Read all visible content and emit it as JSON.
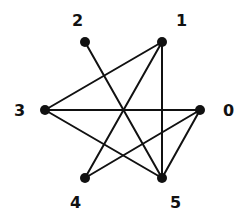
{
  "diagram": {
    "type": "graph",
    "nodes": [
      {
        "id": "0",
        "label": "0",
        "x": 200,
        "y": 110,
        "lx": 223,
        "ly": 116
      },
      {
        "id": "1",
        "label": "1",
        "x": 162,
        "y": 42,
        "lx": 176,
        "ly": 26
      },
      {
        "id": "2",
        "label": "2",
        "x": 85,
        "y": 42,
        "lx": 72,
        "ly": 26
      },
      {
        "id": "3",
        "label": "3",
        "x": 45,
        "y": 110,
        "lx": 14,
        "ly": 116
      },
      {
        "id": "4",
        "label": "4",
        "x": 85,
        "y": 178,
        "lx": 70,
        "ly": 208
      },
      {
        "id": "5",
        "label": "5",
        "x": 162,
        "y": 178,
        "lx": 170,
        "ly": 208
      }
    ],
    "edges": [
      [
        "1",
        "3"
      ],
      [
        "1",
        "5"
      ],
      [
        "1",
        "4"
      ],
      [
        "2",
        "5"
      ],
      [
        "3",
        "0"
      ],
      [
        "3",
        "5"
      ],
      [
        "0",
        "4"
      ],
      [
        "0",
        "5"
      ]
    ],
    "colors": {
      "stroke": "#111111",
      "background": "#ffffff"
    }
  }
}
